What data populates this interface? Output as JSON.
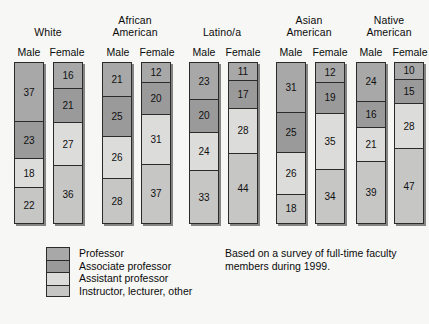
{
  "chart_data": {
    "type": "bar",
    "subtype": "stacked-column-100",
    "title": "",
    "xlabel": "",
    "ylabel": "",
    "ylim": [
      0,
      100
    ],
    "grid": false,
    "legend_position": "bottom-left",
    "annotations": [
      "Based on a survey of full-time faculty members during 1999."
    ],
    "series": [
      {
        "name": "Professor",
        "color": "#a8a8a8",
        "values": [
          37,
          16,
          21,
          12,
          23,
          11,
          31,
          12,
          24,
          10
        ]
      },
      {
        "name": "Associate professor",
        "color": "#9a9a9a",
        "values": [
          23,
          21,
          25,
          20,
          20,
          17,
          25,
          19,
          16,
          15
        ]
      },
      {
        "name": "Assistant professor",
        "color": "#dcdcda",
        "values": [
          18,
          27,
          26,
          31,
          24,
          28,
          26,
          35,
          21,
          28
        ]
      },
      {
        "name": "Instructor, lecturer, other",
        "color": "#c6c6c4",
        "values": [
          22,
          36,
          28,
          37,
          33,
          44,
          18,
          34,
          39,
          47
        ]
      }
    ],
    "categories": [
      "White Male",
      "White Female",
      "African American Male",
      "African American Female",
      "Latino/a Male",
      "Latino/a Female",
      "Asian American Male",
      "Asian American Female",
      "Native American Male",
      "Native American Female"
    ],
    "groups": [
      {
        "name": "White",
        "name_lines": [
          "White"
        ],
        "label_x": 48,
        "bars": [
          {
            "sex": "Male",
            "sex_x": 14,
            "bar_x": 14,
            "values": [
              37,
              23,
              18,
              22
            ]
          },
          {
            "sex": "Female",
            "sex_x": 52,
            "bar_x": 53,
            "values": [
              16,
              21,
              27,
              36
            ]
          }
        ]
      },
      {
        "name": "African American",
        "name_lines": [
          "African",
          "American"
        ],
        "label_x": 135,
        "bars": [
          {
            "sex": "Male",
            "sex_x": 103,
            "bar_x": 102,
            "values": [
              21,
              25,
              26,
              28
            ]
          },
          {
            "sex": "Female",
            "sex_x": 142,
            "bar_x": 141,
            "values": [
              12,
              20,
              31,
              37
            ]
          }
        ]
      },
      {
        "name": "Latino/a",
        "name_lines": [
          "Latino/a"
        ],
        "label_x": 222,
        "bars": [
          {
            "sex": "Male",
            "sex_x": 189,
            "bar_x": 189,
            "values": [
              23,
              20,
              24,
              33
            ]
          },
          {
            "sex": "Female",
            "sex_x": 228,
            "bar_x": 228,
            "values": [
              11,
              17,
              28,
              44
            ]
          }
        ]
      },
      {
        "name": "Asian American",
        "name_lines": [
          "Asian",
          "American"
        ],
        "label_x": 309,
        "bars": [
          {
            "sex": "Male",
            "sex_x": 276,
            "bar_x": 276,
            "values": [
              31,
              25,
              26,
              18
            ]
          },
          {
            "sex": "Female",
            "sex_x": 315,
            "bar_x": 315,
            "values": [
              12,
              19,
              35,
              34
            ]
          }
        ]
      },
      {
        "name": "Native American",
        "name_lines": [
          "Native",
          "American"
        ],
        "label_x": 389,
        "bars": [
          {
            "sex": "Male",
            "sex_x": 356,
            "bar_x": 356,
            "values": [
              24,
              16,
              21,
              39
            ]
          },
          {
            "sex": "Female",
            "sex_x": 395,
            "bar_x": 394,
            "values": [
              10,
              15,
              28,
              47
            ]
          }
        ]
      }
    ]
  },
  "legend": {
    "items": [
      {
        "label": "Professor",
        "color": "#a8a8a8"
      },
      {
        "label": "Associate professor",
        "color": "#9a9a9a"
      },
      {
        "label": "Assistant professor",
        "color": "#dcdcda"
      },
      {
        "label": "Instructor, lecturer, other",
        "color": "#c6c6c4"
      }
    ]
  },
  "source_note": {
    "line1": "Based on a survey of full-time faculty",
    "line2": "members during 1999."
  }
}
